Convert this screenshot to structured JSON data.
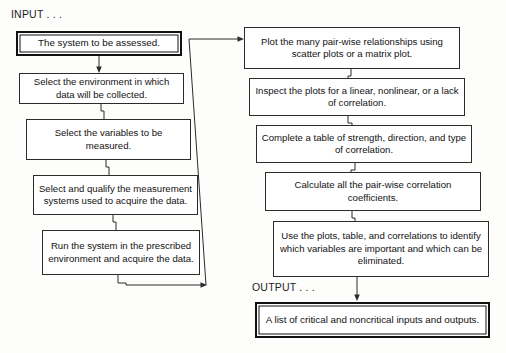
{
  "diagram": {
    "title_input": "INPUT . . .",
    "title_output": "OUTPUT . . .",
    "left_column": [
      {
        "id": "system",
        "text": "The system to be assessed.",
        "emphasis": true
      },
      {
        "id": "environment",
        "text": "Select the environment in which data will be collected.",
        "emphasis": false
      },
      {
        "id": "variables",
        "text": "Select the variables to be measured.",
        "emphasis": false
      },
      {
        "id": "measurement-systems",
        "text": "Select and qualify the measurement systems used to acquire the data.",
        "emphasis": false
      },
      {
        "id": "run-system",
        "text": "Run the system in the prescribed environment and acquire the data.",
        "emphasis": false
      }
    ],
    "right_column": [
      {
        "id": "plot-pairwise",
        "text": "Plot the many pair-wise relationships using scatter plots or a matrix plot.",
        "emphasis": false
      },
      {
        "id": "inspect-plots",
        "text": "Inspect the plots for a linear, nonlinear, or a lack of correlation.",
        "emphasis": false
      },
      {
        "id": "complete-table",
        "text": "Complete a table of strength, direction, and type of correlation.",
        "emphasis": false
      },
      {
        "id": "calculate-coefficients",
        "text": "Calculate all the pair-wise correlation coefficients.",
        "emphasis": false
      },
      {
        "id": "identify-variables",
        "text": "Use the plots, table, and correlations to identify which variables are important and which can be eliminated.",
        "emphasis": false
      },
      {
        "id": "critical-inputs",
        "text": "A list of critical and noncritical inputs and outputs.",
        "emphasis": true
      }
    ],
    "colors": {
      "line": "#2b2b2b",
      "box_border": "#2b2b2b",
      "emphasis_border": "#111111",
      "text": "#121212",
      "background": "#fdfdfc"
    }
  }
}
